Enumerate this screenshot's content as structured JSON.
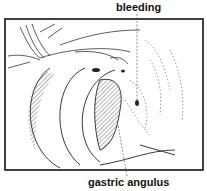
{
  "labels": {
    "top": "bleeding",
    "bottom": "gastric angulus"
  },
  "colors": {
    "line": "#222222",
    "background": "#ffffff"
  }
}
